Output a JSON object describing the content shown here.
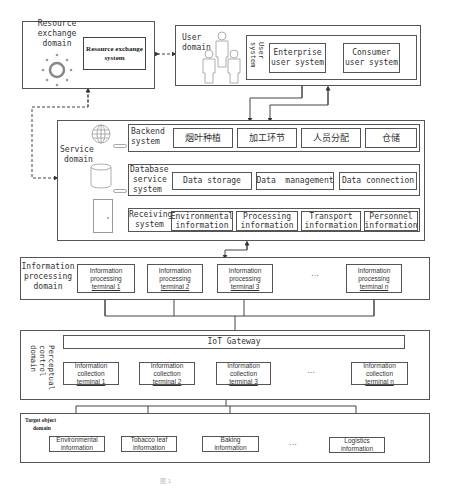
{
  "resource_domain": {
    "label": "Resource exchange domain",
    "label_lines": [
      "Resource",
      "exchange",
      "domain"
    ],
    "system": "Resource exchange system",
    "icon": "hub-circle-icon"
  },
  "user_domain": {
    "label_lines": [
      "User",
      "domain"
    ],
    "icon": "users-group-icon",
    "user_system_label": "User system",
    "enterprise": [
      "Enterprise",
      "user system"
    ],
    "consumer": [
      "Consumer",
      "user system"
    ]
  },
  "service_domain": {
    "label_lines": [
      "Service",
      "domain"
    ],
    "backend": {
      "label_lines": [
        "Backend",
        "system"
      ],
      "icon": "globe-icon",
      "items": [
        "烟叶种植",
        "加工环节",
        "人员分配",
        "仓储"
      ]
    },
    "database": {
      "label_lines": [
        "Database",
        "service",
        "system"
      ],
      "icon": "database-icon",
      "items": [
        "Data storage",
        "Data  management",
        "Data connection"
      ]
    },
    "receiving": {
      "label_lines": [
        "Receiving",
        "system"
      ],
      "icon": "door-icon",
      "items": [
        [
          "Environmental",
          "information"
        ],
        [
          "Processing",
          "information"
        ],
        [
          "Transport",
          "information"
        ],
        [
          "Personnel",
          "information"
        ]
      ]
    }
  },
  "info_processing_domain": {
    "label_lines": [
      "Information",
      "processing",
      "domain"
    ],
    "terminals": [
      [
        "Information",
        "processing",
        "terminal 1"
      ],
      [
        "Information",
        "processing",
        "terminal 2"
      ],
      [
        "Information",
        "processing",
        "terminal 3"
      ],
      [
        "Information",
        "processing",
        "terminal n"
      ]
    ],
    "ellipsis": "···"
  },
  "perceptual_domain": {
    "label_lines": [
      "Perceptual",
      "control",
      "domain"
    ],
    "gateway": "IoT Gateway",
    "terminals": [
      [
        "Information",
        "collection",
        "terminal 1"
      ],
      [
        "Information",
        "collection",
        "terminal 2"
      ],
      [
        "Information",
        "collection",
        "terminal 3"
      ],
      [
        "Information",
        "collection",
        "terminal n"
      ]
    ],
    "ellipsis": "···"
  },
  "target_domain": {
    "label_lines": [
      "Target object",
      "domain"
    ],
    "items": [
      [
        "Environmental",
        "information"
      ],
      [
        "Tobacco leaf",
        "information"
      ],
      [
        "Baking",
        "information"
      ],
      [
        "Logistics",
        "information"
      ]
    ],
    "ellipsis": "···"
  },
  "caption": "图 1"
}
